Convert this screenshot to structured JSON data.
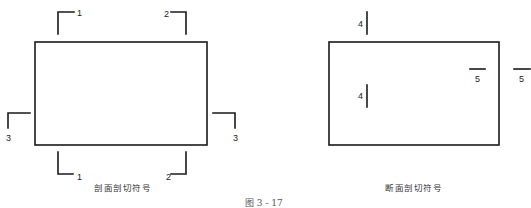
{
  "figure_caption": "图 3 - 17",
  "colors": {
    "line": "#1a1a1a",
    "text": "#222222",
    "background": "#ffffff"
  },
  "left_panel": {
    "caption": "剖面剖切符号",
    "markers": [
      {
        "id": "1-top",
        "label": "1"
      },
      {
        "id": "2-top",
        "label": "2"
      },
      {
        "id": "3-left",
        "label": "3"
      },
      {
        "id": "3-right",
        "label": "3"
      },
      {
        "id": "1-bottom",
        "label": "1"
      },
      {
        "id": "2-bottom",
        "label": "2"
      }
    ]
  },
  "right_panel": {
    "caption": "断面剖切符号",
    "markers": [
      {
        "id": "4-top",
        "label": "4"
      },
      {
        "id": "4-middle",
        "label": "4"
      },
      {
        "id": "5-inside",
        "label": "5"
      },
      {
        "id": "5-outside",
        "label": "5"
      }
    ]
  }
}
